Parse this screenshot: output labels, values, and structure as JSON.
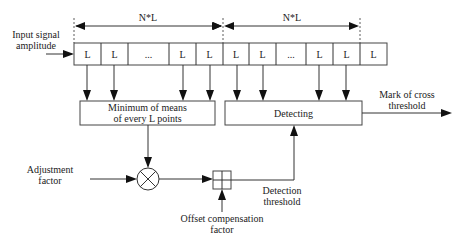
{
  "diagram": {
    "input_label": [
      "Input signal",
      "amplitude"
    ],
    "span_labels": [
      "N*L",
      "N*L"
    ],
    "cells": [
      "L",
      "L",
      "...",
      "L",
      "L",
      "L",
      "L",
      "...",
      "L",
      "L",
      "L"
    ],
    "min_box": [
      "Minimum of means",
      "of every L points"
    ],
    "detect_box": "Detecting",
    "output_label": [
      "Mark of cross",
      "threshold"
    ],
    "adjustment_label": [
      "Adjustment",
      "factor"
    ],
    "offset_label": [
      "Offset compensation",
      "factor"
    ],
    "threshold_label": [
      "Detection",
      "threshold"
    ],
    "multiplier_symbol": "multiply",
    "adder_symbol": "add"
  }
}
